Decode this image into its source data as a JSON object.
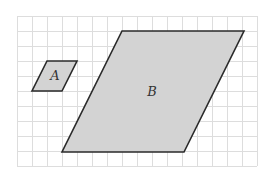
{
  "diagram": {
    "grid": {
      "x0": 17,
      "y0": 16,
      "cell": 15,
      "cols": 16,
      "rows": 10,
      "color": "#dddddd"
    },
    "colors": {
      "fill": "#d3d3d3",
      "stroke": "#2a2a2a"
    },
    "shapes": [
      {
        "label": "A",
        "points": [
          [
            47,
            61
          ],
          [
            77,
            61
          ],
          [
            62,
            91
          ],
          [
            32,
            91
          ]
        ],
        "label_pos": [
          55,
          80
        ]
      },
      {
        "label": "B",
        "points": [
          [
            122,
            31
          ],
          [
            244,
            31
          ],
          [
            184,
            152
          ],
          [
            62,
            152
          ]
        ],
        "label_pos": [
          152,
          96
        ]
      }
    ]
  }
}
